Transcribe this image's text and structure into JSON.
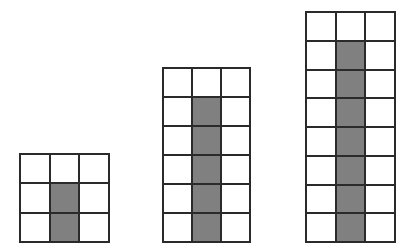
{
  "figure": {
    "fill_color": "#808080",
    "line_color": "#2a2a2a",
    "grids": [
      {
        "id": "grid-1",
        "cols": 3,
        "rows": 3,
        "shaded_column": 2,
        "shaded_rows": [
          2,
          3
        ],
        "shaded_count": 2,
        "left": 19,
        "top": 153,
        "width": 91,
        "height": 90
      },
      {
        "id": "grid-2",
        "cols": 3,
        "rows": 6,
        "shaded_column": 2,
        "shaded_rows": [
          2,
          3,
          4,
          5,
          6
        ],
        "shaded_count": 5,
        "left": 162,
        "top": 67,
        "width": 89,
        "height": 176
      },
      {
        "id": "grid-3",
        "cols": 3,
        "rows": 8,
        "shaded_column": 2,
        "shaded_rows": [
          2,
          3,
          4,
          5,
          6,
          7,
          8
        ],
        "shaded_count": 7,
        "left": 305,
        "top": 11,
        "width": 91,
        "height": 232
      }
    ]
  }
}
